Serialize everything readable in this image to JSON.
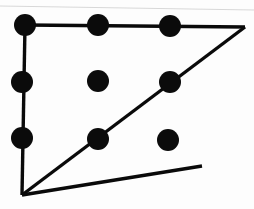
{
  "figure": {
    "kind": "dot-and-line-diagram",
    "background_color": "#fdfdfd",
    "dot_color": "#0b0b0b",
    "line_color": "#0a0a0a",
    "scan_artifact_color": "#d8d8d8",
    "canvas": {
      "width": 254,
      "height": 209
    },
    "dot_radius": 11,
    "line_width": 3.4,
    "scan_artifact": {
      "name": "top-scan-streak",
      "x1": 0,
      "y1": 6,
      "x2": 254,
      "y2": 10
    },
    "dots": [
      {
        "id": "dot-top-left",
        "row": 0,
        "col": 0,
        "cx": 25,
        "cy": 25
      },
      {
        "id": "dot-top-center",
        "row": 0,
        "col": 1,
        "cx": 98,
        "cy": 25
      },
      {
        "id": "dot-top-right",
        "row": 0,
        "col": 2,
        "cx": 170,
        "cy": 26
      },
      {
        "id": "dot-middle-left",
        "row": 1,
        "col": 0,
        "cx": 22,
        "cy": 82
      },
      {
        "id": "dot-middle-center",
        "row": 1,
        "col": 1,
        "cx": 98,
        "cy": 81
      },
      {
        "id": "dot-middle-right",
        "row": 1,
        "col": 2,
        "cx": 170,
        "cy": 82
      },
      {
        "id": "dot-bottom-left",
        "row": 2,
        "col": 0,
        "cx": 22,
        "cy": 138
      },
      {
        "id": "dot-bottom-center",
        "row": 2,
        "col": 1,
        "cx": 98,
        "cy": 139
      },
      {
        "id": "dot-bottom-right",
        "row": 2,
        "col": 2,
        "cx": 168,
        "cy": 140
      }
    ],
    "path_vertices": [
      {
        "id": "vertex-start-top-left",
        "x": 25,
        "y": 25
      },
      {
        "id": "vertex-apex-top-right",
        "x": 245,
        "y": 27
      },
      {
        "id": "vertex-bottom-left-turn",
        "x": 22,
        "y": 195
      },
      {
        "id": "vertex-free-end",
        "x": 202,
        "y": 166
      }
    ],
    "edges": [
      {
        "id": "edge-top-horizontal",
        "from": "dot-top-left",
        "to": "vertex-apex-top-right",
        "x1": 25,
        "y1": 25,
        "x2": 245,
        "y2": 27
      },
      {
        "id": "edge-apex-diagonal",
        "from": "vertex-apex-top-right",
        "to": "vertex-bottom-left-turn",
        "x1": 245,
        "y1": 27,
        "x2": 22,
        "y2": 195
      },
      {
        "id": "edge-left-vertical",
        "from": "dot-top-left",
        "to": "vertex-bottom-left-turn",
        "x1": 25,
        "y1": 25,
        "x2": 22,
        "y2": 195
      },
      {
        "id": "edge-rising-diagonal",
        "from": "vertex-bottom-left-turn",
        "to": "vertex-free-end",
        "x1": 22,
        "y1": 195,
        "x2": 202,
        "y2": 166
      }
    ],
    "crossing_point": {
      "id": "edge-crossing",
      "x": 134,
      "y": 111
    }
  }
}
